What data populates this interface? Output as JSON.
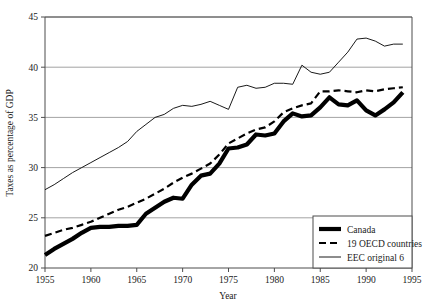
{
  "chart_data": {
    "type": "line",
    "title": "",
    "xlabel": "Year",
    "ylabel": "Taxes as percentage of GDP",
    "xlim": [
      1955,
      1995
    ],
    "ylim": [
      20,
      45
    ],
    "xticks": [
      1955,
      1960,
      1965,
      1970,
      1975,
      1980,
      1985,
      1990,
      1995
    ],
    "yticks": [
      20,
      25,
      30,
      35,
      40,
      45
    ],
    "grid": "horizontal",
    "legend_position": "bottom-right",
    "series": [
      {
        "name": "Canada",
        "style": "thick-solid",
        "color": "#000000",
        "x": [
          1955,
          1956,
          1957,
          1958,
          1959,
          1960,
          1961,
          1962,
          1963,
          1964,
          1965,
          1966,
          1967,
          1968,
          1969,
          1970,
          1971,
          1972,
          1973,
          1974,
          1975,
          1976,
          1977,
          1978,
          1979,
          1980,
          1981,
          1982,
          1983,
          1984,
          1985,
          1986,
          1987,
          1988,
          1989,
          1990,
          1991,
          1992,
          1993,
          1994
        ],
        "values": [
          21.3,
          21.9,
          22.4,
          22.9,
          23.5,
          24.0,
          24.1,
          24.1,
          24.2,
          24.2,
          24.3,
          25.4,
          26.0,
          26.6,
          27.0,
          26.9,
          28.3,
          29.2,
          29.4,
          30.4,
          31.9,
          32.0,
          32.3,
          33.3,
          33.2,
          33.4,
          34.6,
          35.4,
          35.1,
          35.2,
          36.0,
          37.0,
          36.3,
          36.2,
          36.7,
          35.7,
          35.2,
          35.8,
          36.5,
          37.5
        ]
      },
      {
        "name": "19 OECD countries",
        "style": "dashed",
        "color": "#000000",
        "x": [
          1955,
          1956,
          1957,
          1958,
          1959,
          1960,
          1961,
          1962,
          1963,
          1964,
          1965,
          1966,
          1967,
          1968,
          1969,
          1970,
          1971,
          1972,
          1973,
          1974,
          1975,
          1976,
          1977,
          1978,
          1979,
          1980,
          1981,
          1982,
          1983,
          1984,
          1985,
          1986,
          1987,
          1988,
          1989,
          1990,
          1991,
          1992,
          1993,
          1994
        ],
        "values": [
          23.2,
          23.5,
          23.8,
          24.0,
          24.3,
          24.6,
          25.0,
          25.4,
          25.8,
          26.1,
          26.5,
          26.9,
          27.4,
          27.9,
          28.5,
          29.0,
          29.4,
          29.9,
          30.4,
          31.3,
          32.4,
          32.9,
          33.4,
          33.8,
          34.0,
          34.6,
          35.5,
          35.9,
          36.2,
          36.4,
          37.6,
          37.6,
          37.7,
          37.6,
          37.5,
          37.7,
          37.6,
          37.8,
          37.9,
          38.0
        ]
      },
      {
        "name": "EEC original 6",
        "style": "thin-solid",
        "color": "#000000",
        "x": [
          1955,
          1956,
          1957,
          1958,
          1959,
          1960,
          1961,
          1962,
          1963,
          1964,
          1965,
          1966,
          1967,
          1968,
          1969,
          1970,
          1971,
          1972,
          1973,
          1974,
          1975,
          1976,
          1977,
          1978,
          1979,
          1980,
          1981,
          1982,
          1983,
          1984,
          1985,
          1986,
          1987,
          1988,
          1989,
          1990,
          1991,
          1992,
          1993,
          1994
        ],
        "values": [
          27.8,
          28.3,
          28.9,
          29.5,
          30.0,
          30.5,
          31.0,
          31.5,
          32.0,
          32.6,
          33.6,
          34.3,
          35.0,
          35.3,
          35.9,
          36.2,
          36.1,
          36.3,
          36.6,
          36.2,
          35.8,
          38.0,
          38.2,
          37.9,
          38.0,
          38.4,
          38.4,
          38.3,
          40.2,
          39.5,
          39.3,
          39.5,
          40.5,
          41.5,
          42.8,
          42.9,
          42.6,
          42.1,
          42.3,
          42.3
        ]
      }
    ]
  },
  "axes": {
    "y_label": "Taxes as percentage of GDP",
    "x_label": "Year",
    "y_ticks": [
      "20",
      "25",
      "30",
      "35",
      "40",
      "45"
    ],
    "x_ticks": [
      "1955",
      "1960",
      "1965",
      "1970",
      "1975",
      "1980",
      "1985",
      "1990",
      "1995"
    ]
  },
  "legend": {
    "items": [
      {
        "label": "Canada",
        "swatch": "thick-solid-swatch"
      },
      {
        "label": "19 OECD countries",
        "swatch": "dashed-swatch"
      },
      {
        "label": "EEC original 6",
        "swatch": "thin-solid-swatch"
      }
    ]
  }
}
